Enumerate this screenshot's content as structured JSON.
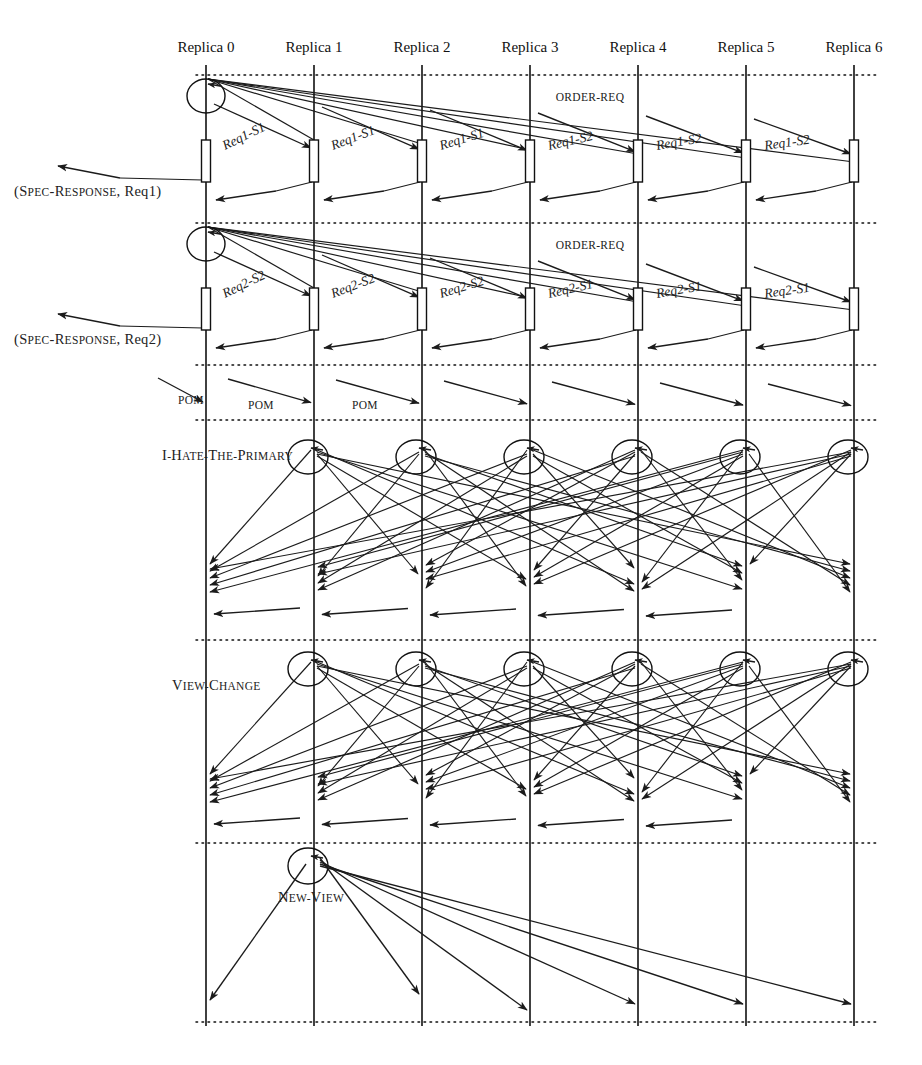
{
  "diagram": {
    "replica_count": 7,
    "lifelines": [
      {
        "id": "r0",
        "label": "Replica 0",
        "x": 206
      },
      {
        "id": "r1",
        "label": "Replica 1",
        "x": 314
      },
      {
        "id": "r2",
        "label": "Replica 2",
        "x": 422
      },
      {
        "id": "r3",
        "label": "Replica 3",
        "x": 530
      },
      {
        "id": "r4",
        "label": "Replica 4",
        "x": 638
      },
      {
        "id": "r5",
        "label": "Replica 5",
        "x": 746
      },
      {
        "id": "r6",
        "label": "Replica 6",
        "x": 854
      }
    ],
    "phase_separators_y": [
      75,
      223,
      365,
      420,
      640,
      843,
      1022
    ],
    "phases": [
      {
        "id": "order-req-1",
        "order_req_label": "ORDER-REQ",
        "order_req_label_x": 590,
        "order_req_label_y": 101,
        "spec_response_label": "(SPEC-RESPONSE, Req1)",
        "spec_response_small_caps": "SPEC-RESPONSE",
        "spec_response_x": 14,
        "spec_response_y": 196,
        "segment_labels": [
          {
            "text": "Req1-S1",
            "x": 225,
            "y": 150,
            "rotate": -26
          },
          {
            "text": "Req1-S1",
            "x": 333,
            "y": 150,
            "rotate": -21
          },
          {
            "text": "Req1-S1",
            "x": 441,
            "y": 150,
            "rotate": -17
          },
          {
            "text": "Req1-S2",
            "x": 549,
            "y": 150,
            "rotate": -13
          },
          {
            "text": "Req1-S2",
            "x": 657,
            "y": 150,
            "rotate": -10
          },
          {
            "text": "Req1-S2",
            "x": 765,
            "y": 150,
            "rotate": -8
          }
        ]
      },
      {
        "id": "order-req-2",
        "order_req_label": "ORDER-REQ",
        "order_req_label_x": 590,
        "order_req_label_y": 249,
        "spec_response_label": "(SPEC-RESPONSE, Req2)",
        "spec_response_small_caps": "SPEC-RESPONSE",
        "spec_response_x": 14,
        "spec_response_y": 344,
        "segment_labels": [
          {
            "text": "Req2-S2",
            "x": 225,
            "y": 298,
            "rotate": -26
          },
          {
            "text": "Req2-S2",
            "x": 333,
            "y": 298,
            "rotate": -21
          },
          {
            "text": "Req2-S2",
            "x": 441,
            "y": 298,
            "rotate": -17
          },
          {
            "text": "Req2-S1",
            "x": 549,
            "y": 298,
            "rotate": -13
          },
          {
            "text": "Req2-S1",
            "x": 657,
            "y": 298,
            "rotate": -10
          },
          {
            "text": "Req2-S1",
            "x": 765,
            "y": 298,
            "rotate": -8
          }
        ]
      },
      {
        "id": "pom",
        "labels": [
          {
            "text": "POM",
            "x": 178,
            "y": 404
          },
          {
            "text": "POM",
            "x": 248,
            "y": 409
          },
          {
            "text": "POM",
            "x": 352,
            "y": 409
          }
        ]
      },
      {
        "id": "i-hate-the-primary",
        "label": "I-HATE-THE-PRIMARY",
        "label_x": 162,
        "label_y": 460
      },
      {
        "id": "view-change",
        "label": "VIEW-CHANGE",
        "label_x": 172,
        "label_y": 690
      },
      {
        "id": "new-view",
        "label": "NEW-VIEW",
        "label_x": 278,
        "label_y": 902
      }
    ],
    "colors": {
      "line": "#111111",
      "background": "#ffffff",
      "text": "#222222"
    }
  }
}
